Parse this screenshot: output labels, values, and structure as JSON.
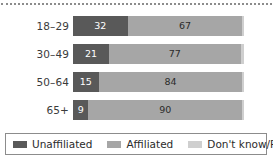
{
  "chart_data": {
    "type": "bar",
    "orientation": "horizontal",
    "stacked": true,
    "title": "",
    "subtitle": "",
    "xlabel": "",
    "ylabel": "",
    "xlim": [
      0,
      100
    ],
    "grid": false,
    "legend_position": "bottom",
    "categories": [
      "18–29",
      "30–49",
      "50–64",
      "65+"
    ],
    "series": [
      {
        "name": "Unaffiliated",
        "color": "#595959",
        "values": [
          32,
          21,
          15,
          9
        ]
      },
      {
        "name": "Affiliated",
        "color": "#a6a6a6",
        "values": [
          67,
          77,
          84,
          90
        ]
      },
      {
        "name": "Don't know/Refused",
        "color": "#cfcfcf",
        "values": [
          1,
          2,
          1,
          1
        ]
      }
    ],
    "value_labels_shown": [
      "Unaffiliated",
      "Affiliated"
    ],
    "rows": [
      {
        "category": "18–29",
        "unaffiliated": 32,
        "affiliated": 67,
        "dk": 1,
        "unaffiliated_label": "32",
        "affiliated_label": "67",
        "dk_label": ""
      },
      {
        "category": "30–49",
        "unaffiliated": 21,
        "affiliated": 77,
        "dk": 2,
        "unaffiliated_label": "21",
        "affiliated_label": "77",
        "dk_label": ""
      },
      {
        "category": "50–64",
        "unaffiliated": 15,
        "affiliated": 84,
        "dk": 1,
        "unaffiliated_label": "15",
        "affiliated_label": "84",
        "dk_label": ""
      },
      {
        "category": "65+",
        "unaffiliated": 9,
        "affiliated": 90,
        "dk": 1,
        "unaffiliated_label": "9",
        "affiliated_label": "90",
        "dk_label": ""
      }
    ],
    "legend": [
      {
        "label": "Unaffiliated",
        "color": "#595959"
      },
      {
        "label": "Affiliated",
        "color": "#a6a6a6"
      },
      {
        "label": "Don't know/Refused",
        "color": "#cfcfcf"
      }
    ]
  },
  "colors": {
    "background": "#ffffff",
    "unaffiliated": "#595959",
    "affiliated": "#a6a6a6",
    "dont_know": "#cfcfcf",
    "text": "#2b2b2b",
    "axis_label": "#3b3b3b",
    "rule": "#8c8c8c"
  }
}
